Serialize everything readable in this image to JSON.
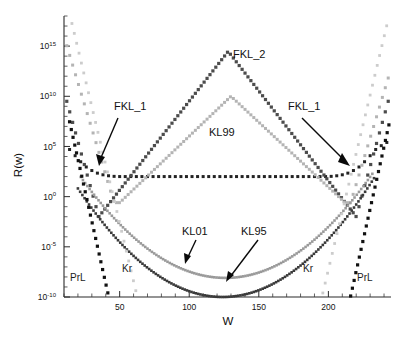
{
  "chart_data": {
    "type": "scatter",
    "title": "",
    "xlabel": "W",
    "ylabel": "R(w)",
    "xlim": [
      10,
      245
    ],
    "ylim": [
      1e-10,
      1e+18
    ],
    "yscale": "log",
    "xscale": "linear",
    "grid": false,
    "legend_position": "inline-annotations",
    "xticks": [
      50,
      100,
      150,
      200
    ],
    "xticklabels": [
      "50",
      "100",
      "150",
      "200"
    ],
    "yticks": [
      1000000000000000.0,
      10000000000.0,
      100000.0,
      1.0,
      1e-05,
      1e-10
    ],
    "yticklabels": [
      {
        "mantissa": "10",
        "exponent": "15"
      },
      {
        "mantissa": "10",
        "exponent": "10"
      },
      {
        "mantissa": "10",
        "exponent": "5"
      },
      {
        "mantissa": "10",
        "exponent": "0"
      },
      {
        "mantissa": "10",
        "exponent": "-5"
      },
      {
        "mantissa": "10",
        "exponent": "-10"
      }
    ],
    "series": [
      {
        "name": "FKL_1",
        "color": "#232323",
        "marker": "square",
        "marker_size": 3.0,
        "description": "U-shaped branches; broad flat minimum near 10^2 across the mid range",
        "points_x": [
          14,
          18,
          22,
          26,
          30,
          34,
          38,
          42,
          46,
          50,
          54,
          58,
          62,
          66,
          70,
          74,
          78,
          82,
          86,
          90,
          94,
          98,
          102,
          106,
          110,
          114,
          118,
          122,
          126,
          130,
          134,
          138,
          142,
          146,
          150,
          154,
          158,
          162,
          166,
          170,
          174,
          178,
          182,
          186,
          190,
          194,
          198,
          202,
          206,
          210,
          214,
          218,
          222,
          226,
          230,
          234,
          238,
          242
        ],
        "points_y": [
          50000.0,
          12000.0,
          3000.0,
          900.0,
          400.0,
          220.0,
          150.0,
          120.0,
          105.0,
          100.0,
          100.0,
          100.0,
          100.0,
          100.0,
          100.0,
          100.0,
          100.0,
          100.0,
          100.0,
          100.0,
          100.0,
          100.0,
          100.0,
          100.0,
          100.0,
          100.0,
          100.0,
          100.0,
          100.0,
          100.0,
          100.0,
          100.0,
          100.0,
          100.0,
          100.0,
          100.0,
          100.0,
          100.0,
          100.0,
          100.0,
          100.0,
          100.0,
          100.0,
          100.0,
          100.0,
          100.0,
          100.0,
          105.0,
          120.0,
          150.0,
          220.0,
          400.0,
          900.0,
          3000.0,
          12000.0,
          50000.0,
          120000.0,
          250000.0
        ]
      },
      {
        "name": "FKL_2",
        "color": "#4c4c4c",
        "marker": "square",
        "marker_size": 3.2,
        "description": "Large inverted-V peaking near W=128 at about 10^14, with deep V minima near W=35 and W=220",
        "peak_x": 128,
        "peak_y": 300000000000000.0,
        "minima_x": [
          35,
          220
        ],
        "minima_y": [
          0.01,
          0.01
        ]
      },
      {
        "name": "KL99",
        "color": "#b4b4b4",
        "marker": "square",
        "marker_size": 3.0,
        "description": "Inverted-V peaking near W=130 at about 10^10; descends to ~10^-1 plateau near the edges",
        "peak_x": 130,
        "peak_y": 10000000000.0
      },
      {
        "name": "KL01",
        "color": "#9a9a9a",
        "marker": "square",
        "marker_size": 2.6,
        "description": "Broad U-shaped valley with minimum near W=126 at about 10^-9",
        "min_x": 126,
        "min_y": 8e-09
      },
      {
        "name": "KL95",
        "color": "#3a3a3a",
        "marker": "square",
        "marker_size": 2.6,
        "description": "Broad U-shaped valley with minimum near W=124 at about 10^-10, lying just below KL01",
        "min_x": 124,
        "min_y": 1e-10
      },
      {
        "name": "Kr",
        "color": "#cccccc",
        "marker": "square",
        "marker_size": 2.8,
        "description": "Steep light-grey V branches reaching down off-scale near W=62 and W=196"
      },
      {
        "name": "PrL",
        "color": "#111111",
        "marker": "square",
        "marker_size": 3.2,
        "description": "Steep dark near-vertical branches dropping to 10^-10 at W=42 and W=216"
      }
    ],
    "annotations": [
      {
        "text": "FKL_2",
        "x": 128,
        "y": 300000000000000.0,
        "label_side": "right"
      },
      {
        "text": "FKL_1",
        "x": 38,
        "y": 100.0,
        "label_side": "upper-right",
        "arrow": true
      },
      {
        "text": "FKL_1",
        "x": 222,
        "y": 100.0,
        "label_side": "upper-left",
        "arrow": true
      },
      {
        "text": "KL99",
        "x": 140,
        "y": 100000000.0,
        "label_side": "right"
      },
      {
        "text": "KL01",
        "x": 100,
        "y": 1e-05,
        "label_side": "upper-left",
        "arrow": true
      },
      {
        "text": "KL95",
        "x": 124,
        "y": 1e-10,
        "label_side": "upper-right",
        "arrow": true
      },
      {
        "text": "Kr",
        "x": 62,
        "y": 1e-06,
        "label_side": "left"
      },
      {
        "text": "Kr",
        "x": 196,
        "y": 1e-06,
        "label_side": "right"
      },
      {
        "text": "PrL",
        "x": 42,
        "y": 1e-07,
        "label_side": "left"
      },
      {
        "text": "PrL",
        "x": 216,
        "y": 1e-07,
        "label_side": "right"
      }
    ]
  },
  "axes": {
    "y_title": "R(w)",
    "x_title": "W",
    "x_tick_labels": [
      "50",
      "100",
      "150",
      "200"
    ],
    "y_tick_labels": [
      "10^15",
      "10^10",
      "10^5",
      "10^0",
      "10^-5",
      "10^-10"
    ]
  },
  "series_labels": {
    "fkl2": "FKL_2",
    "fkl1_left": "FKL_1",
    "fkl1_right": "FKL_1",
    "kl99": "KL99",
    "kl01": "KL01",
    "kl95": "KL95",
    "kr_left": "Kr",
    "kr_right": "Kr",
    "prl_left": "PrL",
    "prl_right": "PrL"
  }
}
